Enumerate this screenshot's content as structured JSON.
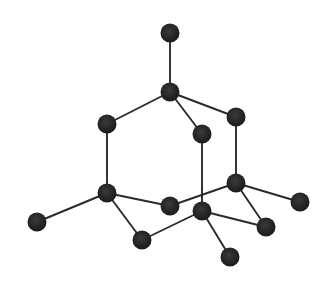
{
  "diagram": {
    "type": "ball-and-stick crystal structure (diamond lattice fragment)",
    "background": "#ffffff",
    "atom_color": "#222222",
    "bond_color": "#2a2a2a",
    "atom_radius": 9.5,
    "atoms": [
      {
        "id": "A",
        "x": 170,
        "y": 33
      },
      {
        "id": "B",
        "x": 170,
        "y": 92
      },
      {
        "id": "C",
        "x": 107,
        "y": 124
      },
      {
        "id": "D",
        "x": 236,
        "y": 117
      },
      {
        "id": "E",
        "x": 202,
        "y": 134
      },
      {
        "id": "F",
        "x": 107,
        "y": 193
      },
      {
        "id": "G",
        "x": 170,
        "y": 206
      },
      {
        "id": "H",
        "x": 236,
        "y": 183
      },
      {
        "id": "I",
        "x": 202,
        "y": 211
      },
      {
        "id": "J",
        "x": 37,
        "y": 222
      },
      {
        "id": "K",
        "x": 142,
        "y": 240
      },
      {
        "id": "L",
        "x": 300,
        "y": 202
      },
      {
        "id": "M",
        "x": 266,
        "y": 227
      },
      {
        "id": "N",
        "x": 230,
        "y": 257
      }
    ],
    "bonds": [
      [
        "A",
        "B"
      ],
      [
        "B",
        "C"
      ],
      [
        "B",
        "D"
      ],
      [
        "B",
        "E"
      ],
      [
        "C",
        "F"
      ],
      [
        "D",
        "H"
      ],
      [
        "E",
        "I"
      ],
      [
        "F",
        "J"
      ],
      [
        "F",
        "G"
      ],
      [
        "F",
        "K"
      ],
      [
        "G",
        "H"
      ],
      [
        "H",
        "L"
      ],
      [
        "H",
        "M"
      ],
      [
        "K",
        "I"
      ],
      [
        "I",
        "M"
      ],
      [
        "I",
        "N"
      ]
    ]
  }
}
